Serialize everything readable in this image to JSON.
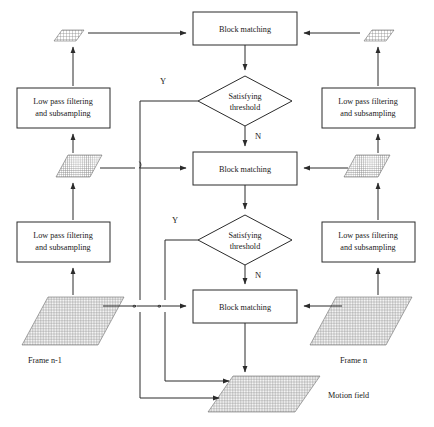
{
  "diagram": {
    "title_type": "hierarchical block matching motion estimation flowchart",
    "process_boxes": [
      {
        "id": "block-matching-top",
        "label": "Block matching"
      },
      {
        "id": "block-matching-middle",
        "label": "Block matching"
      },
      {
        "id": "block-matching-bottom",
        "label": "Block matching"
      }
    ],
    "decision_nodes": [
      {
        "id": "decision-top",
        "line1": "Satisfying",
        "line2": "threshold",
        "yes": "Y",
        "no": "N"
      },
      {
        "id": "decision-bottom",
        "line1": "Satisfying",
        "line2": "threshold",
        "yes": "Y",
        "no": "N"
      }
    ],
    "filter_boxes": [
      {
        "id": "low-pass-upper-left",
        "line1": "Low pass filtering",
        "line2": "and subsampling"
      },
      {
        "id": "low-pass-lower-left",
        "line1": "Low pass filtering",
        "line2": "and subsampling"
      },
      {
        "id": "low-pass-upper-right",
        "line1": "Low pass filtering",
        "line2": "and subsampling"
      },
      {
        "id": "low-pass-lower-right",
        "line1": "Low pass filtering",
        "line2": "and subsampling"
      }
    ],
    "captions": {
      "frame_previous": "Frame n-1",
      "frame_current": "Frame n",
      "motion_field": "Motion field"
    },
    "grids": [
      {
        "id": "grid-left-small",
        "level": "coarsest",
        "side": "left"
      },
      {
        "id": "grid-left-medium",
        "level": "middle",
        "side": "left"
      },
      {
        "id": "grid-left-large",
        "level": "finest",
        "side": "left"
      },
      {
        "id": "grid-right-small",
        "level": "coarsest",
        "side": "right"
      },
      {
        "id": "grid-right-medium",
        "level": "middle",
        "side": "right"
      },
      {
        "id": "grid-right-large",
        "level": "finest",
        "side": "right"
      },
      {
        "id": "grid-motion-field",
        "level": "output",
        "side": "center"
      }
    ],
    "colors": {
      "stroke": "#2b2b2b",
      "text": "#1a1a1a",
      "grid_line": "#8a8a8a",
      "background": "#ffffff"
    }
  }
}
